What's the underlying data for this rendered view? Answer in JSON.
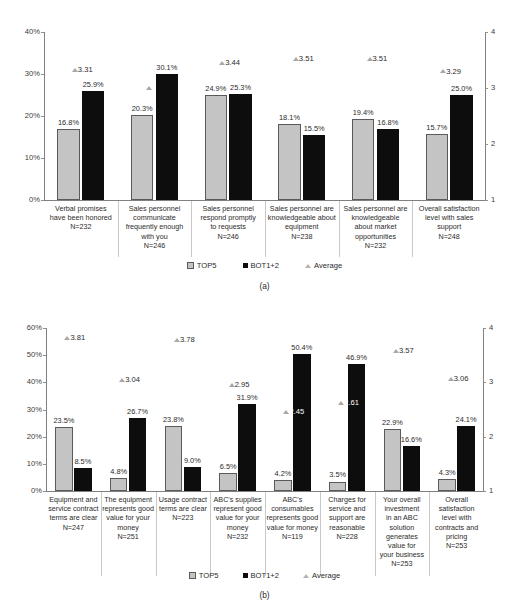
{
  "figure": {
    "panels": [
      {
        "caption": "(a)",
        "legend": [
          {
            "label": "TOP5",
            "icon": "square-gray-swatch"
          },
          {
            "label": "BOT1+2",
            "icon": "square-black-swatch"
          },
          {
            "label": "Average",
            "icon": "triangle-gray-swatch"
          }
        ]
      },
      {
        "caption": "(b)",
        "legend": [
          {
            "label": "TOP5",
            "icon": "square-gray-swatch"
          },
          {
            "label": "BOT1+2",
            "icon": "square-black-swatch"
          },
          {
            "label": "Average",
            "icon": "triangle-gray-swatch"
          }
        ]
      }
    ]
  },
  "chart_data": [
    {
      "type": "bar",
      "title": "",
      "subtitle": "(a)",
      "xlabel": "",
      "ylabel": "",
      "ylim": [
        0,
        40
      ],
      "y2lim": [
        1,
        4
      ],
      "yticks": [
        "0%",
        "10%",
        "20%",
        "30%",
        "40%"
      ],
      "y2ticks": [
        "1",
        "2",
        "3",
        "4"
      ],
      "grid": false,
      "legend_position": "bottom",
      "categories": [
        "Verbal promises have been honored\nN=232",
        "Sales personnel communicate frequently enough with you\nN=246",
        "Sales personnel respond promptly to requests\nN=246",
        "Sales personnel are knowledgeable about equipment\nN=238",
        "Sales personnel are knowledgeable about market opportunities\nN=232",
        "Overall satisfaction level with sales support\nN=248"
      ],
      "category_lines": [
        [
          "Verbal promises",
          "have been honored",
          "N=232"
        ],
        [
          "Sales personnel",
          "communicate",
          "frequently enough",
          "with you",
          "N=246"
        ],
        [
          "Sales personnel",
          "respond promptly",
          "to requests",
          "N=246"
        ],
        [
          "Sales personnel are",
          "knowledgeable about",
          "equipment",
          "N=238"
        ],
        [
          "Sales personnel are",
          "knowledgeable",
          "about market",
          "opportunities",
          "N=232"
        ],
        [
          "Overall satisfaction",
          "level with sales",
          "support",
          "N=248"
        ]
      ],
      "sample_sizes": [
        232,
        246,
        246,
        238,
        232,
        248
      ],
      "series": [
        {
          "name": "TOP5",
          "axis": "left",
          "values": [
            16.8,
            20.3,
            24.9,
            18.1,
            19.4,
            15.7
          ],
          "labels": [
            "16.8%",
            "20.3%",
            "24.9%",
            "18.1%",
            "19.4%",
            "15.7%"
          ]
        },
        {
          "name": "BOT1+2",
          "axis": "left",
          "values": [
            25.9,
            30.1,
            25.3,
            15.5,
            16.8,
            25.0
          ],
          "labels": [
            "25.9%",
            "30.1%",
            "25.3%",
            "15.5%",
            "16.8%",
            "25.0%"
          ]
        },
        {
          "name": "Average",
          "axis": "right",
          "values": [
            3.31,
            2.99,
            3.44,
            3.51,
            3.51,
            3.29
          ],
          "labels": [
            "3.31",
            "",
            "3.44",
            "3.51",
            "3.51",
            "3.29"
          ]
        }
      ]
    },
    {
      "type": "bar",
      "title": "",
      "subtitle": "(b)",
      "xlabel": "",
      "ylabel": "",
      "ylim": [
        0,
        60
      ],
      "y2lim": [
        1,
        4
      ],
      "yticks": [
        "0%",
        "10%",
        "20%",
        "30%",
        "40%",
        "50%",
        "60%"
      ],
      "y2ticks": [
        "1",
        "2",
        "3",
        "4"
      ],
      "grid": false,
      "legend_position": "bottom",
      "categories": [
        "Equipment and service contract terms are clear\nN=247",
        "The equipment represents good value for your money\nN=251",
        "Usage contract terms are clear\nN=223",
        "ABC's supplies represent good value for your money\nN=232",
        "ABC's consumables represents good value for money\nN=119",
        "Charges for service and support are reasonable\nN=228",
        "Your overall investment in an ABC solution generates value for your business\nN=253",
        "Overall satisfaction level with contracts and pricing\nN=253"
      ],
      "category_lines": [
        [
          "Equipment and",
          "service contract",
          "terms are clear",
          "N=247"
        ],
        [
          "The equipment",
          "represents good",
          "value for your",
          "money",
          "N=251"
        ],
        [
          "Usage contract",
          "terms are clear",
          "N=223"
        ],
        [
          "ABC's supplies",
          "represent good",
          "value for your",
          "money",
          "N=232"
        ],
        [
          "ABC's",
          "consumables",
          "represents good",
          "value for money",
          "N=119"
        ],
        [
          "Charges for",
          "service and",
          "support are",
          "reasonable",
          "N=228"
        ],
        [
          "Your overall",
          "investment",
          "in an ABC",
          "solution",
          "generates",
          "value for",
          "your business",
          "N=253"
        ],
        [
          "Overall",
          "satisfaction",
          "level with",
          "contracts and",
          "pricing",
          "N=253"
        ]
      ],
      "sample_sizes": [
        247,
        251,
        223,
        232,
        119,
        228,
        253,
        253
      ],
      "series": [
        {
          "name": "TOP5",
          "axis": "left",
          "values": [
            23.5,
            4.8,
            23.8,
            6.5,
            4.2,
            3.5,
            22.9,
            4.3
          ],
          "labels": [
            "23.5%",
            "4.8%",
            "23.8%",
            "6.5%",
            "4.2%",
            "3.5%",
            "22.9%",
            "4.3%"
          ]
        },
        {
          "name": "BOT1+2",
          "axis": "left",
          "values": [
            8.5,
            26.7,
            9.0,
            31.9,
            50.4,
            46.9,
            16.6,
            24.1
          ],
          "labels": [
            "8.5%",
            "26.7%",
            "9.0%",
            "31.9%",
            "50.4%",
            "46.9%",
            "16.6%",
            "24.1%"
          ]
        },
        {
          "name": "Average",
          "axis": "right",
          "values": [
            3.81,
            3.04,
            3.78,
            2.95,
            2.45,
            2.61,
            3.57,
            3.06
          ],
          "labels": [
            "3.81",
            "3.04",
            "3.78",
            "2.95",
            "2.45",
            "2.61",
            "3.57",
            "3.06"
          ]
        }
      ]
    }
  ]
}
